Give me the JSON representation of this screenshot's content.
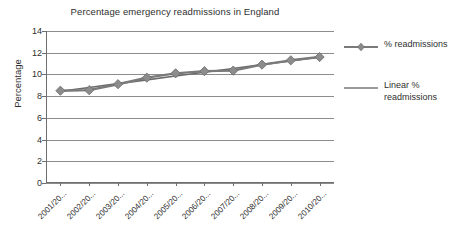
{
  "chart_data": {
    "type": "line",
    "title": "Percentage emergency readmissions in England",
    "xlabel": "",
    "ylabel": "Percentage",
    "categories": [
      "2001/20...",
      "2002/20...",
      "2003/20...",
      "2004/20...",
      "2005/20...",
      "2006/20...",
      "2007/20...",
      "2008/20...",
      "2009/20...",
      "2010/20..."
    ],
    "series": [
      {
        "name": "% readmissions",
        "marker": "diamond",
        "color": "#7a7a7a",
        "values": [
          8.5,
          8.55,
          9.1,
          9.7,
          10.1,
          10.3,
          10.35,
          10.9,
          11.3,
          11.6
        ]
      },
      {
        "name": "Linear % readmissions",
        "marker": "none",
        "color": "#6b6b6b",
        "trendline": true,
        "values": [
          8.45,
          8.8,
          9.15,
          9.5,
          9.85,
          10.2,
          10.55,
          10.9,
          11.25,
          11.6
        ]
      }
    ],
    "ylim": [
      0,
      14
    ],
    "ytick_step": 2,
    "yticks": [
      "0",
      "2",
      "4",
      "6",
      "8",
      "10",
      "12",
      "14"
    ],
    "grid": true,
    "legend_position": "right"
  },
  "legend": {
    "entries": [
      {
        "label": "% readmissions"
      },
      {
        "label": "Linear % readmissions"
      }
    ]
  },
  "axes": {
    "y_title": "Percentage"
  }
}
